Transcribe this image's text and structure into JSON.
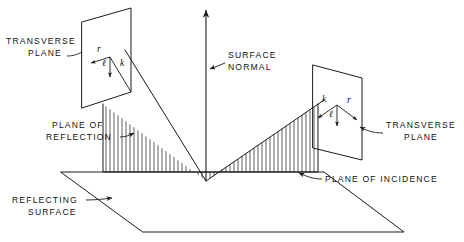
{
  "figure": {
    "type": "technical-line-diagram",
    "background_color": "#ffffff",
    "line_color": "#1a1a1a"
  },
  "labels": {
    "transverse_plane_left": "TRANSVERSE\nPLANE",
    "transverse_plane_left_line1": "TRANSVERSE",
    "transverse_plane_left_line2": "PLANE",
    "transverse_plane_right_line1": "TRANSVERSE",
    "transverse_plane_right_line2": "PLANE",
    "surface_normal_line1": "SURFACE",
    "surface_normal_line2": "NORMAL",
    "plane_of_reflection_line1": "PLANE OF",
    "plane_of_reflection_line2": "REFLECTION",
    "plane_of_incidence": "PLANE OF INCIDENCE",
    "reflecting_surface_line1": "REFLECTING",
    "reflecting_surface_line2": "SURFACE"
  },
  "vectors": {
    "left_plane": [
      {
        "name": "r",
        "label": "r",
        "direction": "up-left"
      },
      {
        "name": "l",
        "label": "ℓ",
        "direction": "down"
      },
      {
        "name": "k",
        "label": "k",
        "direction": "down-right"
      }
    ],
    "right_plane": [
      {
        "name": "k",
        "label": "k",
        "direction": "down-left"
      },
      {
        "name": "l",
        "label": "ℓ",
        "direction": "down"
      },
      {
        "name": "r",
        "label": "r",
        "direction": "down-right"
      }
    ]
  },
  "geometry": {
    "vertex": {
      "x": 206,
      "y": 181
    },
    "normal_tip": {
      "x": 206,
      "y": 8
    },
    "reflecting_surface_corners": [
      {
        "x": 61,
        "y": 172
      },
      {
        "x": 324,
        "y": 172
      },
      {
        "x": 404,
        "y": 232
      },
      {
        "x": 143,
        "y": 232
      }
    ],
    "left_transverse_plane_corners": [
      {
        "x": 82,
        "y": 22
      },
      {
        "x": 131,
        "y": 8
      },
      {
        "x": 131,
        "y": 92
      },
      {
        "x": 82,
        "y": 108
      }
    ],
    "right_transverse_plane_corners": [
      {
        "x": 313,
        "y": 65
      },
      {
        "x": 362,
        "y": 78
      },
      {
        "x": 362,
        "y": 160
      },
      {
        "x": 313,
        "y": 148
      }
    ],
    "incident_ray": {
      "from": {
        "x": 131,
        "y": 60
      },
      "to": {
        "x": 206,
        "y": 181
      }
    },
    "reflected_ray": {
      "from": {
        "x": 206,
        "y": 181
      },
      "to": {
        "x": 318,
        "y": 104
      }
    }
  }
}
